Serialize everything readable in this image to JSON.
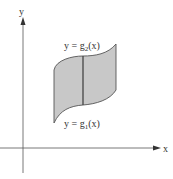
{
  "diagram": {
    "type": "region-between-curves",
    "axes": {
      "x_label": "x",
      "y_label": "y"
    },
    "upper_curve": {
      "prefix": "y = g",
      "subscript": "2",
      "suffix": "(x)"
    },
    "lower_curve": {
      "prefix": "y = g",
      "subscript": "1",
      "suffix": "(x)"
    },
    "colors": {
      "region_fill": "#c8c8c8",
      "stroke": "#555555",
      "axis": "#444444"
    }
  }
}
